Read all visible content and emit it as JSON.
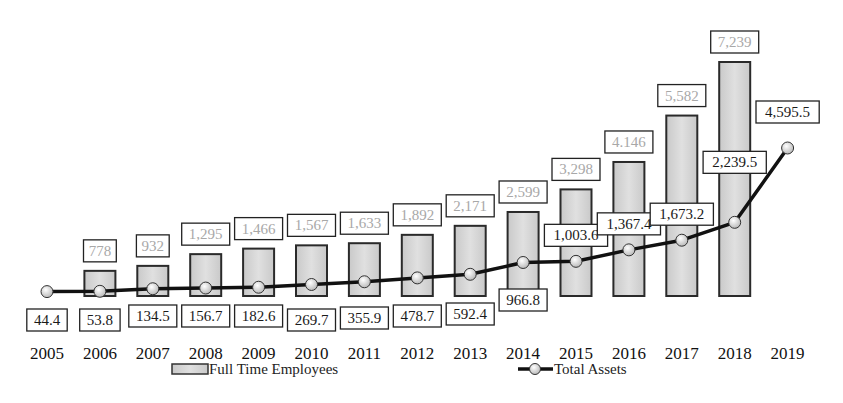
{
  "chart_data": {
    "type": "bar",
    "title": "",
    "xlabel": "",
    "ylabel": "",
    "grid": false,
    "legend_position": "bottom",
    "categories": [
      "2005",
      "2006",
      "2007",
      "2008",
      "2009",
      "2010",
      "2011",
      "2012",
      "2013",
      "2014",
      "2015",
      "2016",
      "2017",
      "2018",
      "2019"
    ],
    "series": [
      {
        "name": "Full Time Employees",
        "type": "bar",
        "values": [
          null,
          778,
          932,
          1295,
          1466,
          1567,
          1633,
          1892,
          2171,
          2599,
          3298,
          4146,
          5582,
          7239,
          null
        ],
        "labels": [
          "",
          "778",
          "932",
          "1,295",
          "1,466",
          "1,567",
          "1,633",
          "1,892",
          "2,171",
          "2,599",
          "3,298",
          "4.146",
          "5,582",
          "7,239",
          ""
        ]
      },
      {
        "name": "Total Assets",
        "type": "line",
        "values": [
          44.4,
          53.8,
          134.5,
          156.7,
          182.6,
          269.7,
          355.9,
          478.7,
          592.4,
          966.8,
          1003.6,
          1367.4,
          1673.2,
          2239.5,
          4595.5
        ],
        "labels": [
          "44.4",
          "53.8",
          "134.5",
          "156.7",
          "182.6",
          "269.7",
          "355.9",
          "478.7",
          "592.4",
          "966.8",
          "1,003.6",
          "1,367.4",
          "1,673.2",
          "2,239.5",
          "4,595.5"
        ]
      }
    ]
  },
  "legend": {
    "employees_label": "Full Time Employees",
    "assets_label": "Total Assets"
  },
  "colors": {
    "bar_fill": "#d6d6d6",
    "bar_stroke": "#2a2a2a",
    "line": "#111111",
    "marker_fill": "#e8e8e8",
    "employee_label_text": "#a8a8a8",
    "asset_label_text": "#1a1a1a"
  }
}
